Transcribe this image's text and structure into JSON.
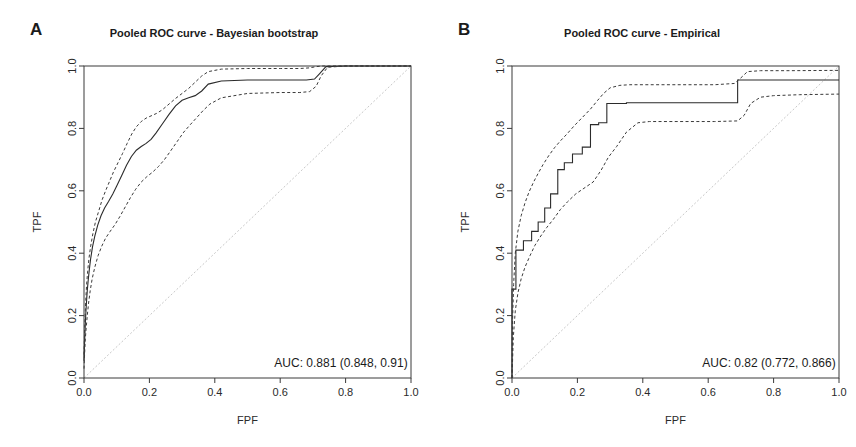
{
  "figure": {
    "width": 856,
    "height": 447,
    "background": "#ffffff",
    "line_color": "#2b2b2b",
    "ci_color": "#3a3a3a",
    "diagonal_color": "#c8c8c8"
  },
  "panels": [
    {
      "id": "A",
      "label": "A",
      "title": "Pooled ROC curve - Bayesian bootstrap",
      "auc_text": "AUC: 0.881 (0.848, 0.91)"
    },
    {
      "id": "B",
      "label": "B",
      "title": "Pooled ROC curve - Empirical",
      "auc_text": "AUC: 0.82 (0.772, 0.866)"
    }
  ],
  "chart_data": [
    {
      "type": "line",
      "panel": "A",
      "title": "Pooled ROC curve - Bayesian bootstrap",
      "xlabel": "FPF",
      "ylabel": "TPF",
      "xlim": [
        0,
        1
      ],
      "ylim": [
        0,
        1
      ],
      "xticks": [
        0.0,
        0.2,
        0.4,
        0.6,
        0.8,
        1.0
      ],
      "yticks": [
        0.0,
        0.2,
        0.4,
        0.6,
        0.8,
        1.0
      ],
      "xticklabels": [
        "0.0",
        "0.2",
        "0.4",
        "0.6",
        "0.8",
        "1.0"
      ],
      "yticklabels": [
        "0.0",
        "0.2",
        "0.4",
        "0.6",
        "0.8",
        "1.0"
      ],
      "grid": false,
      "legend": "none",
      "annotations": [
        {
          "text": "AUC: 0.881 (0.848, 0.91)",
          "x": 0.99,
          "y": 0.035,
          "align": "right"
        }
      ],
      "auc": 0.881,
      "auc_ci": [
        0.848,
        0.91
      ],
      "reference_line": {
        "style": "dashed",
        "x": [
          0,
          1
        ],
        "y": [
          0,
          1
        ],
        "color": "#c8c8c8"
      },
      "series": [
        {
          "name": "Pooled ROC (posterior mean)",
          "style": "solid",
          "x": [
            0.0,
            0.002,
            0.004,
            0.006,
            0.008,
            0.01,
            0.013,
            0.016,
            0.02,
            0.026,
            0.033,
            0.042,
            0.052,
            0.063,
            0.075,
            0.088,
            0.1,
            0.115,
            0.13,
            0.145,
            0.16,
            0.175,
            0.19,
            0.205,
            0.22,
            0.24,
            0.26,
            0.28,
            0.3,
            0.32,
            0.34,
            0.36,
            0.38,
            0.42,
            0.5,
            0.6,
            0.68,
            0.705,
            0.72,
            0.74,
            0.8,
            0.9,
            1.0
          ],
          "y": [
            0.055,
            0.12,
            0.175,
            0.215,
            0.25,
            0.28,
            0.315,
            0.345,
            0.38,
            0.42,
            0.455,
            0.49,
            0.52,
            0.545,
            0.566,
            0.59,
            0.615,
            0.648,
            0.682,
            0.71,
            0.73,
            0.742,
            0.752,
            0.765,
            0.785,
            0.815,
            0.845,
            0.872,
            0.89,
            0.898,
            0.905,
            0.92,
            0.942,
            0.952,
            0.955,
            0.955,
            0.955,
            0.958,
            0.975,
            0.998,
            1.0,
            1.0,
            1.0
          ]
        },
        {
          "name": "Upper 95% credible band",
          "style": "dashed",
          "x": [
            0.0,
            0.002,
            0.004,
            0.006,
            0.008,
            0.011,
            0.015,
            0.02,
            0.027,
            0.035,
            0.045,
            0.055,
            0.066,
            0.078,
            0.09,
            0.104,
            0.118,
            0.132,
            0.146,
            0.16,
            0.175,
            0.19,
            0.205,
            0.222,
            0.24,
            0.26,
            0.28,
            0.3,
            0.32,
            0.34,
            0.36,
            0.38,
            0.42,
            0.5,
            0.6,
            0.66,
            0.69,
            0.71,
            0.73,
            0.8,
            0.9,
            1.0
          ],
          "y": [
            0.075,
            0.155,
            0.215,
            0.262,
            0.3,
            0.34,
            0.382,
            0.42,
            0.462,
            0.5,
            0.535,
            0.57,
            0.6,
            0.63,
            0.66,
            0.69,
            0.72,
            0.752,
            0.782,
            0.805,
            0.822,
            0.833,
            0.84,
            0.848,
            0.86,
            0.878,
            0.896,
            0.912,
            0.928,
            0.948,
            0.968,
            0.982,
            0.99,
            0.992,
            0.992,
            0.992,
            0.994,
            0.998,
            1.0,
            1.0,
            1.0,
            1.0
          ]
        },
        {
          "name": "Lower 95% credible band",
          "style": "dashed",
          "x": [
            0.0,
            0.002,
            0.004,
            0.007,
            0.01,
            0.014,
            0.019,
            0.025,
            0.033,
            0.043,
            0.054,
            0.066,
            0.08,
            0.095,
            0.11,
            0.126,
            0.142,
            0.158,
            0.175,
            0.192,
            0.21,
            0.228,
            0.246,
            0.265,
            0.285,
            0.305,
            0.325,
            0.345,
            0.365,
            0.385,
            0.42,
            0.5,
            0.6,
            0.66,
            0.69,
            0.71,
            0.725,
            0.745,
            0.8,
            0.9,
            1.0
          ],
          "y": [
            0.03,
            0.08,
            0.125,
            0.165,
            0.2,
            0.24,
            0.28,
            0.318,
            0.355,
            0.392,
            0.422,
            0.448,
            0.47,
            0.492,
            0.518,
            0.548,
            0.578,
            0.605,
            0.628,
            0.645,
            0.66,
            0.678,
            0.7,
            0.728,
            0.758,
            0.788,
            0.812,
            0.835,
            0.858,
            0.878,
            0.898,
            0.912,
            0.915,
            0.915,
            0.918,
            0.935,
            0.968,
            0.996,
            1.0,
            1.0,
            1.0
          ]
        }
      ]
    },
    {
      "type": "line",
      "panel": "B",
      "title": "Pooled ROC curve - Empirical",
      "xlabel": "FPF",
      "ylabel": "TPF",
      "xlim": [
        0,
        1
      ],
      "ylim": [
        0,
        1
      ],
      "xticks": [
        0.0,
        0.2,
        0.4,
        0.6,
        0.8,
        1.0
      ],
      "yticks": [
        0.0,
        0.2,
        0.4,
        0.6,
        0.8,
        1.0
      ],
      "xticklabels": [
        "0.0",
        "0.2",
        "0.4",
        "0.6",
        "0.8",
        "1.0"
      ],
      "yticklabels": [
        "0.0",
        "0.2",
        "0.4",
        "0.6",
        "0.8",
        "1.0"
      ],
      "grid": false,
      "legend": "none",
      "annotations": [
        {
          "text": "AUC: 0.82 (0.772, 0.866)",
          "x": 0.99,
          "y": 0.035,
          "align": "right"
        }
      ],
      "auc": 0.82,
      "auc_ci": [
        0.772,
        0.866
      ],
      "reference_line": {
        "style": "dashed",
        "x": [
          0,
          1
        ],
        "y": [
          0,
          1
        ],
        "color": "#c8c8c8"
      },
      "series": [
        {
          "name": "Pooled empirical ROC (step)",
          "style": "solid-step",
          "x": [
            0.0,
            0.0,
            0.012,
            0.012,
            0.035,
            0.035,
            0.06,
            0.06,
            0.08,
            0.08,
            0.1,
            0.1,
            0.118,
            0.118,
            0.14,
            0.14,
            0.16,
            0.16,
            0.185,
            0.185,
            0.215,
            0.215,
            0.24,
            0.24,
            0.265,
            0.265,
            0.29,
            0.29,
            0.35,
            0.35,
            0.69,
            0.69,
            1.0
          ],
          "y": [
            0.0,
            0.285,
            0.285,
            0.41,
            0.41,
            0.44,
            0.44,
            0.47,
            0.47,
            0.5,
            0.5,
            0.545,
            0.545,
            0.59,
            0.59,
            0.668,
            0.668,
            0.69,
            0.69,
            0.718,
            0.718,
            0.74,
            0.74,
            0.812,
            0.812,
            0.818,
            0.818,
            0.88,
            0.88,
            0.882,
            0.882,
            0.955,
            0.955
          ]
        },
        {
          "name": "Upper 95% confidence band",
          "style": "dashed",
          "x": [
            0.0,
            0.002,
            0.005,
            0.01,
            0.018,
            0.028,
            0.04,
            0.052,
            0.066,
            0.08,
            0.095,
            0.112,
            0.13,
            0.148,
            0.168,
            0.19,
            0.215,
            0.24,
            0.262,
            0.28,
            0.3,
            0.33,
            0.36,
            0.42,
            0.52,
            0.62,
            0.68,
            0.7,
            0.72,
            0.76,
            0.85,
            1.0
          ],
          "y": [
            0.0,
            0.195,
            0.3,
            0.4,
            0.47,
            0.52,
            0.562,
            0.596,
            0.628,
            0.656,
            0.684,
            0.712,
            0.738,
            0.76,
            0.782,
            0.808,
            0.835,
            0.862,
            0.89,
            0.912,
            0.93,
            0.938,
            0.94,
            0.94,
            0.94,
            0.94,
            0.944,
            0.962,
            0.982,
            0.985,
            0.985,
            0.986
          ]
        },
        {
          "name": "Lower 95% confidence band",
          "style": "dashed",
          "x": [
            0.0,
            0.004,
            0.01,
            0.018,
            0.028,
            0.04,
            0.055,
            0.07,
            0.088,
            0.106,
            0.126,
            0.148,
            0.17,
            0.195,
            0.22,
            0.248,
            0.272,
            0.295,
            0.32,
            0.35,
            0.385,
            0.42,
            0.52,
            0.62,
            0.69,
            0.71,
            0.73,
            0.76,
            0.8,
            0.88,
            1.0
          ],
          "y": [
            0.0,
            0.13,
            0.215,
            0.272,
            0.318,
            0.356,
            0.392,
            0.425,
            0.455,
            0.482,
            0.508,
            0.54,
            0.565,
            0.59,
            0.608,
            0.628,
            0.665,
            0.708,
            0.742,
            0.788,
            0.818,
            0.822,
            0.822,
            0.822,
            0.824,
            0.842,
            0.88,
            0.9,
            0.905,
            0.908,
            0.91
          ]
        }
      ]
    }
  ]
}
